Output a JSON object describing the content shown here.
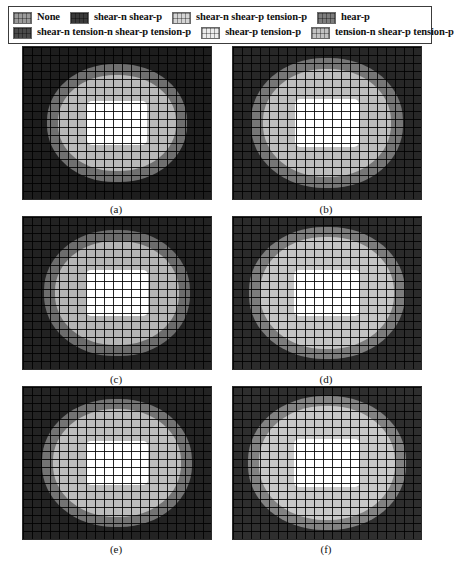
{
  "figure": {
    "type": "plasticity-state-contour-grid",
    "rows": 3,
    "cols": 2
  },
  "legend": {
    "name": "plasticity-state-legend",
    "rows": [
      [
        {
          "label": "None",
          "color": "#9a9a9a"
        },
        {
          "label": "shear-n shear-p",
          "color": "#3a3a3a"
        },
        {
          "label": "shear-n shear-p tension-p",
          "color": "#d4d4d4"
        },
        {
          "label": "hear-p",
          "color": "#7d7d7d"
        }
      ],
      [
        {
          "label": "shear-n tension-n shear-p tension-p",
          "color": "#4a4a4a"
        },
        {
          "label": "shear-p tension-p",
          "color": "#ececec"
        },
        {
          "label": "tension-n shear-p tension-p",
          "color": "#c2c2c2"
        }
      ]
    ]
  },
  "panels": [
    {
      "caption": "(a)",
      "name": "panel-a",
      "background": "#1d1d1d",
      "outer_zone": {
        "color": "#6f6f6f",
        "width": 140,
        "height": 118
      },
      "inner_zone": {
        "color": "#b9b9b9",
        "width": 118,
        "height": 96
      },
      "opening": {
        "color": "#ffffff",
        "width": 60,
        "height": 44
      }
    },
    {
      "caption": "(b)",
      "name": "panel-b",
      "background": "#272727",
      "outer_zone": {
        "color": "#767676",
        "width": 152,
        "height": 130
      },
      "inner_zone": {
        "color": "#bdbdbd",
        "width": 128,
        "height": 108
      },
      "opening": {
        "color": "#ffffff",
        "width": 64,
        "height": 48
      }
    },
    {
      "caption": "(c)",
      "name": "panel-c",
      "background": "#222222",
      "outer_zone": {
        "color": "#6c6c6c",
        "width": 146,
        "height": 126
      },
      "inner_zone": {
        "color": "#b5b5b5",
        "width": 124,
        "height": 104
      },
      "opening": {
        "color": "#ffffff",
        "width": 62,
        "height": 46
      }
    },
    {
      "caption": "(d)",
      "name": "panel-d",
      "background": "#2b2b2b",
      "outer_zone": {
        "color": "#7c7c7c",
        "width": 156,
        "height": 132
      },
      "inner_zone": {
        "color": "#c4c4c4",
        "width": 134,
        "height": 112
      },
      "opening": {
        "color": "#ffffff",
        "width": 66,
        "height": 46
      }
    },
    {
      "caption": "(e)",
      "name": "panel-e",
      "background": "#232323",
      "outer_zone": {
        "color": "#737373",
        "width": 150,
        "height": 128
      },
      "inner_zone": {
        "color": "#bcbcbc",
        "width": 128,
        "height": 108
      },
      "opening": {
        "color": "#ffffff",
        "width": 62,
        "height": 44
      }
    },
    {
      "caption": "(f)",
      "name": "panel-f",
      "background": "#2e2e2e",
      "outer_zone": {
        "color": "#828282",
        "width": 158,
        "height": 134
      },
      "inner_zone": {
        "color": "#c8c8c8",
        "width": 136,
        "height": 114
      },
      "opening": {
        "color": "#ffffff",
        "width": 66,
        "height": 48
      }
    }
  ]
}
